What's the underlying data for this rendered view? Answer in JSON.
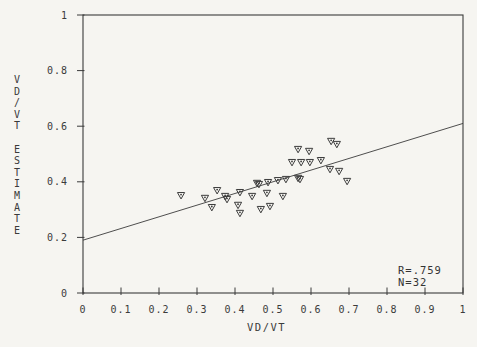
{
  "figure": {
    "background": "#f6f5f1",
    "ink": "#3b3b3b"
  },
  "chart_data": {
    "type": "scatter",
    "title": "",
    "xlabel": "VD/VT",
    "ylabel": "VD/VT ESTIMATE",
    "xlim": [
      0,
      1
    ],
    "ylim": [
      0,
      1
    ],
    "grid": false,
    "legend": null,
    "marker": "open-triangle-down-with-center-dot",
    "x_ticks": [
      0,
      0.1,
      0.2,
      0.3,
      0.4,
      0.5,
      0.6,
      0.7,
      0.8,
      0.9,
      1
    ],
    "x_tick_labels": [
      "0",
      "0.1",
      "0.2",
      "0.3",
      "0.4",
      "0.5",
      "0.6",
      "0.7",
      "0.8",
      "0.9",
      "1"
    ],
    "y_ticks": [
      0,
      0.2,
      0.4,
      0.6,
      0.8,
      1
    ],
    "y_tick_labels": [
      "0",
      "0.2",
      "0.4",
      "0.6",
      "0.8",
      "1"
    ],
    "points": [
      [
        0.258,
        0.352
      ],
      [
        0.321,
        0.342
      ],
      [
        0.339,
        0.309
      ],
      [
        0.353,
        0.37
      ],
      [
        0.374,
        0.349
      ],
      [
        0.379,
        0.338
      ],
      [
        0.413,
        0.363
      ],
      [
        0.408,
        0.317
      ],
      [
        0.413,
        0.288
      ],
      [
        0.445,
        0.349
      ],
      [
        0.458,
        0.396
      ],
      [
        0.463,
        0.392
      ],
      [
        0.468,
        0.302
      ],
      [
        0.484,
        0.36
      ],
      [
        0.492,
        0.313
      ],
      [
        0.487,
        0.399
      ],
      [
        0.513,
        0.406
      ],
      [
        0.526,
        0.349
      ],
      [
        0.534,
        0.41
      ],
      [
        0.55,
        0.471
      ],
      [
        0.566,
        0.518
      ],
      [
        0.566,
        0.414
      ],
      [
        0.571,
        0.41
      ],
      [
        0.574,
        0.471
      ],
      [
        0.595,
        0.511
      ],
      [
        0.597,
        0.471
      ],
      [
        0.626,
        0.478
      ],
      [
        0.653,
        0.547
      ],
      [
        0.668,
        0.536
      ],
      [
        0.65,
        0.446
      ],
      [
        0.674,
        0.439
      ],
      [
        0.695,
        0.403
      ]
    ],
    "trendline": {
      "x": [
        0,
        1
      ],
      "y": [
        0.19,
        0.61
      ]
    },
    "annotations": [
      {
        "text": "R=.759"
      },
      {
        "text": "N=32"
      }
    ]
  },
  "stats": {
    "r_label": "R=.759",
    "n_label": "N=32"
  }
}
